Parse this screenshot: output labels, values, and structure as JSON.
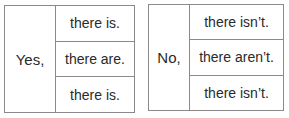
{
  "tables": [
    {
      "lead": "Yes,",
      "rows": [
        "there is.",
        "there are.",
        "there is."
      ]
    },
    {
      "lead": "No,",
      "rows": [
        "there isn’t.",
        "there aren’t.",
        "there isn’t."
      ]
    }
  ]
}
